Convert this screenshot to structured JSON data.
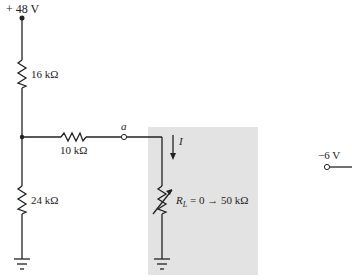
{
  "diagram": {
    "type": "circuit",
    "supply": {
      "label": "+ 48 V",
      "value_v": 48
    },
    "resistors": [
      {
        "id": "R1",
        "label": "16 kΩ",
        "value_kohm": 16,
        "orientation": "vertical",
        "position": "upper-left"
      },
      {
        "id": "R2",
        "label": "24 kΩ",
        "value_kohm": 24,
        "orientation": "vertical",
        "position": "lower-left"
      },
      {
        "id": "R3",
        "label": "10 kΩ",
        "value_kohm": 10,
        "orientation": "horizontal",
        "position": "middle"
      }
    ],
    "node": {
      "label": "a"
    },
    "current": {
      "label": "I",
      "direction": "down"
    },
    "load": {
      "symbol": "R",
      "subscript": "L",
      "range_text": " = 0 → 50 kΩ",
      "min_kohm": 0,
      "max_kohm": 50,
      "variable": true,
      "shaded_region": true
    },
    "terminal": {
      "label": "−6 V",
      "value_v": -6
    },
    "grounds": 2,
    "colors": {
      "shade": "#e3e3e3",
      "wire": "#222222"
    }
  }
}
